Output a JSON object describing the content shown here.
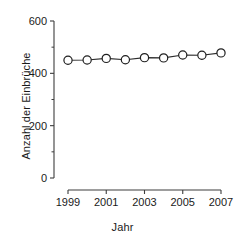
{
  "chart_data": {
    "type": "line",
    "title": "",
    "xlabel": "Jahr",
    "ylabel": "Anzahl der Einbrüche",
    "x": [
      1999,
      2000,
      2001,
      2002,
      2003,
      2004,
      2005,
      2006,
      2007
    ],
    "values": [
      450,
      451,
      457,
      452,
      460,
      459,
      470,
      469,
      478
    ],
    "series": [
      {
        "name": "Anzahl der Einbrüche",
        "values": [
          450,
          451,
          457,
          452,
          460,
          459,
          470,
          469,
          478
        ]
      }
    ],
    "xlim": [
      1999,
      2007
    ],
    "ylim": [
      0,
      600
    ],
    "ytick_major": [
      0,
      200,
      400,
      600
    ],
    "ytick_minor": [
      100,
      300,
      500
    ],
    "ytick_labels": [
      "0",
      "200",
      "400",
      "600"
    ],
    "xtick_major": [
      1999,
      2001,
      2003,
      2005,
      2007
    ],
    "xtick_minor": [
      2000,
      2002,
      2004,
      2006
    ],
    "xtick_labels": [
      "1999",
      "2001",
      "2003",
      "2005",
      "2007"
    ],
    "grid": false,
    "legend": "none",
    "marker": "open-circle",
    "line_color": "#2b2b2b",
    "marker_fill": "#ffffff",
    "marker_stroke": "#1f1f1f",
    "axis_color": "#3d3d3d",
    "background": "#ffffff"
  }
}
